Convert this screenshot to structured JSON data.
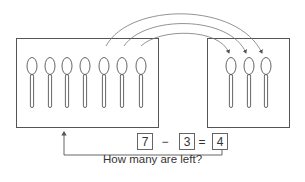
{
  "diagram": {
    "left_box": {
      "spoon_count": 7,
      "spoon_x": [
        32,
        50,
        67,
        85,
        104,
        122,
        141
      ]
    },
    "right_box": {
      "spoon_count": 3,
      "spoon_x": [
        231,
        249,
        266
      ]
    },
    "arrows": {
      "count": 3,
      "from": "left_box spoons 5-7",
      "to": "right_box spoons"
    },
    "equation": {
      "a": "7",
      "op": "−",
      "b": "3",
      "eq": "=",
      "result": "4"
    },
    "caption": "How many are left?",
    "colors": {
      "stroke": "#555555",
      "text": "#333333"
    }
  }
}
